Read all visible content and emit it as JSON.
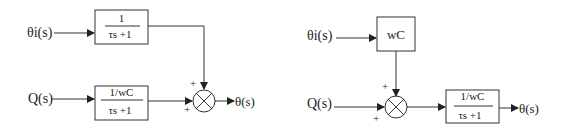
{
  "diagrams": [
    {
      "name": "left-block-diagram",
      "input_top": "θi(s)",
      "input_bottom": "Q(s)",
      "block_top": {
        "numerator": "1",
        "denominator": "τs +1"
      },
      "block_bottom": {
        "numerator": "1/wC",
        "denominator": "τs +1"
      },
      "junction_signs": {
        "top": "+",
        "left": "+"
      },
      "output": "θ(s)"
    },
    {
      "name": "right-block-diagram",
      "input_top": "θi(s)",
      "input_bottom": "Q(s)",
      "block_top": {
        "label": "wC"
      },
      "block_output": {
        "numerator": "1/wC",
        "denominator": "τs +1"
      },
      "junction_signs": {
        "top": "+",
        "left": "+"
      },
      "output": "θ(s)"
    }
  ],
  "colors": {
    "line": "#333333",
    "text": "#222222",
    "background": "#ffffff"
  }
}
